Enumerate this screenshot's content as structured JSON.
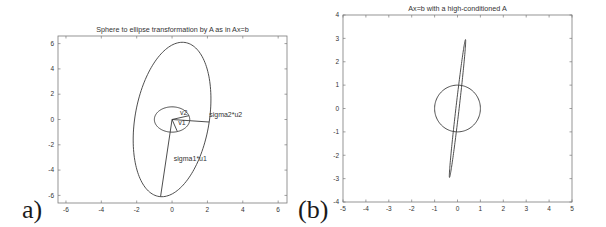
{
  "panels": [
    {
      "label": "a)",
      "title": "Sphere to ellipse transformation by A as in Ax=b",
      "box": {
        "x0": 58,
        "y0": 36,
        "x1": 287,
        "y1": 203
      },
      "xlim": [
        -6.45,
        6.5
      ],
      "ylim": [
        -6.6,
        6.6
      ],
      "xticks": [
        -6,
        -4,
        -2,
        0,
        2,
        4,
        6
      ],
      "yticks": [
        -6,
        -4,
        -2,
        0,
        2,
        4,
        6
      ]
    },
    {
      "label": "(b)",
      "title": "Ax=b with a high-conditioned A",
      "box": {
        "x0": 343,
        "y0": 15,
        "x1": 572,
        "y1": 202
      },
      "xlim": [
        -5,
        5
      ],
      "ylim": [
        -4,
        4
      ],
      "xticks": [
        -5,
        -4,
        -3,
        -2,
        -1,
        0,
        1,
        2,
        3,
        4,
        5
      ],
      "yticks": [
        -4,
        -3,
        -2,
        -1,
        0,
        1,
        2,
        3,
        4
      ]
    }
  ],
  "chart_data": [
    {
      "type": "line",
      "title": "Sphere to ellipse transformation by A as in Ax=b",
      "xlabel": "",
      "ylabel": "",
      "xlim": [
        -6.45,
        6.5
      ],
      "ylim": [
        -6.6,
        6.6
      ],
      "grid": false,
      "series": [
        {
          "name": "unit circle",
          "shape": "circle",
          "center": [
            0,
            0
          ],
          "radius": 1
        },
        {
          "name": "transformed ellipse",
          "shape": "ellipse",
          "center": [
            0,
            0
          ],
          "semi_axis_1": [
            -0.65,
            -6.1
          ],
          "semi_axis_2": [
            2.1,
            -0.2
          ]
        },
        {
          "name": "v1",
          "shape": "segment",
          "from": [
            0,
            0
          ],
          "to": [
            0.3,
            -0.95
          ]
        },
        {
          "name": "v2",
          "shape": "segment",
          "from": [
            0,
            0
          ],
          "to": [
            0.95,
            0.3
          ]
        },
        {
          "name": "sigma1*u1",
          "shape": "segment",
          "from": [
            0,
            0
          ],
          "to": [
            -0.65,
            -6.1
          ]
        },
        {
          "name": "sigma2*u2",
          "shape": "segment",
          "from": [
            0,
            0
          ],
          "to": [
            2.1,
            -0.2
          ]
        }
      ],
      "annotations": [
        {
          "text": "v2",
          "x": 0.45,
          "y": 0.35
        },
        {
          "text": "v1",
          "x": 0.35,
          "y": -0.45
        },
        {
          "text": "sigma2*u2",
          "x": 2.1,
          "y": 0.2
        },
        {
          "text": "sigma1*u1",
          "x": 0.1,
          "y": -3.3
        }
      ]
    },
    {
      "type": "line",
      "title": "Ax=b with a high-conditioned A",
      "xlabel": "",
      "ylabel": "",
      "xlim": [
        -5,
        5
      ],
      "ylim": [
        -4,
        4
      ],
      "grid": false,
      "series": [
        {
          "name": "unit circle",
          "shape": "circle",
          "center": [
            0,
            0
          ],
          "radius": 1
        },
        {
          "name": "transformed ellipse",
          "shape": "ellipse",
          "center": [
            0,
            0
          ],
          "semi_axis_1": [
            0.35,
            2.95
          ],
          "semi_axis_2": [
            0.07,
            -0.01
          ]
        }
      ],
      "annotations": []
    }
  ],
  "colors": {
    "line": "#3a3a3a",
    "axis": "#7a7a7a",
    "text": "#333333",
    "background": "#ffffff"
  }
}
